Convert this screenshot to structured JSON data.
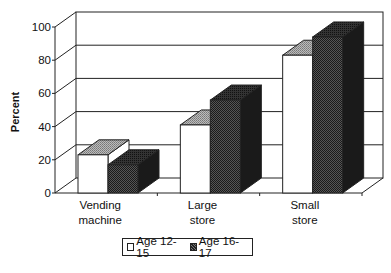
{
  "chart_data": {
    "type": "bar",
    "style": "3d-clustered-column",
    "title": "",
    "xlabel": "",
    "ylabel": "Percent",
    "ylim": [
      0,
      100
    ],
    "yticks": [
      "0",
      "20",
      "40",
      "60",
      "80",
      "100"
    ],
    "grid": true,
    "legend_position": "bottom",
    "categories": [
      "Vending machine",
      "Large store",
      "Small store"
    ],
    "category_lines": [
      [
        "Vending",
        "machine"
      ],
      [
        "Large",
        "store"
      ],
      [
        "Small",
        "store"
      ]
    ],
    "series": [
      {
        "name": "Age 12-15",
        "values": [
          23,
          41,
          83
        ],
        "fill": "#ffffff"
      },
      {
        "name": "Age 16-17",
        "values": [
          17,
          56,
          94
        ],
        "fill": "#3a3a3a"
      }
    ]
  },
  "legend": {
    "items": [
      {
        "label": "Age 12-15"
      },
      {
        "label": "Age 16-17"
      }
    ]
  }
}
